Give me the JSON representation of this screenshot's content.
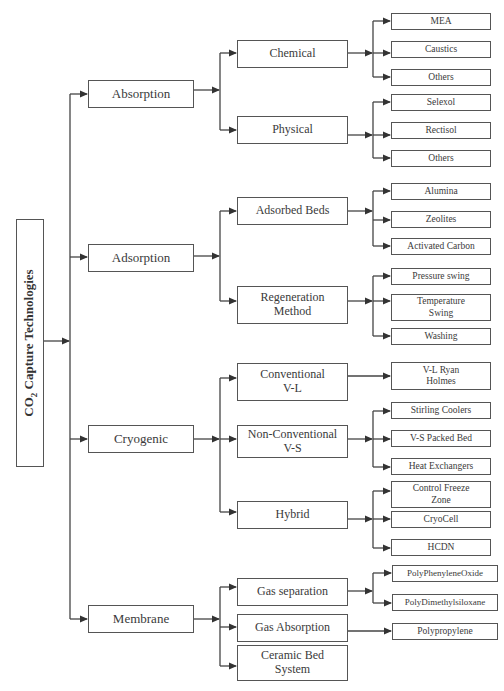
{
  "diagram": {
    "root": {
      "label_prefix": "CO",
      "label_sub": "2",
      "label_suffix": " Capture Technologies"
    },
    "categories": [
      {
        "label": "Absorption",
        "children": [
          {
            "label": "Chemical",
            "items": [
              "MEA",
              "Caustics",
              "Others"
            ]
          },
          {
            "label": "Physical",
            "items": [
              "Selexol",
              "Rectisol",
              "Others"
            ]
          }
        ]
      },
      {
        "label": "Adsorption",
        "children": [
          {
            "label": "Adsorbed Beds",
            "items": [
              "Alumina",
              "Zeolites",
              "Activated Carbon"
            ]
          },
          {
            "label": "Regeneration Method",
            "items": [
              "Pressure swing",
              "Temperature Swing",
              "Washing"
            ]
          }
        ]
      },
      {
        "label": "Cryogenic",
        "children": [
          {
            "label": "Conventional V-L",
            "items": [
              "V-L Ryan Holmes"
            ]
          },
          {
            "label": "Non-Conventional V-S",
            "items": [
              "Stirling Coolers",
              "V-S Packed Bed",
              "Heat Exchangers"
            ]
          },
          {
            "label": "Hybrid",
            "items": [
              "Control Freeze Zone",
              "CryoCell",
              "HCDN"
            ]
          }
        ]
      },
      {
        "label": "Membrane",
        "children": [
          {
            "label": "Gas separation",
            "items": [
              "PolyPhenyleneOxide",
              "PolyDimethylsiloxane"
            ]
          },
          {
            "label": "Gas Absorption",
            "items": [
              "Polypropylene"
            ]
          },
          {
            "label": "Ceramic Bed System",
            "items": []
          }
        ]
      }
    ],
    "colors": {
      "line": "#444444",
      "box_border": "#555555",
      "text": "#3a3a3a"
    }
  }
}
